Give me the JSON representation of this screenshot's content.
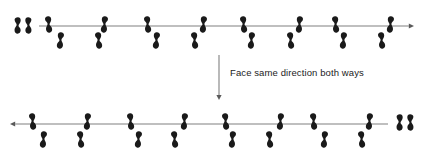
{
  "canvas": {
    "width": 424,
    "height": 151,
    "background": "#ffffff"
  },
  "colors": {
    "footprint": "#1a1a1a",
    "axis_line": "#808080",
    "arrow_head": "#5a5a5a",
    "text": "#1c1c1c"
  },
  "caption": {
    "label": "Face same direction both ways",
    "x": 230,
    "y": 68
  },
  "transition_arrow": {
    "name": "down-arrow",
    "direction": "down",
    "x": 219,
    "y_start": 55,
    "y_end": 100
  },
  "rows": [
    {
      "id": "top-row",
      "name": "walking-path-left-to-right",
      "direction": "right",
      "axis": {
        "x_start": 39,
        "x_end": 414,
        "y": 26,
        "arrow_direction": "right"
      },
      "start_pair": {
        "name": "start-position-pair",
        "feet": [
          {
            "side": "left",
            "x": 14,
            "y": 17,
            "rotation": 0
          },
          {
            "side": "right",
            "x": 25,
            "y": 17,
            "rotation": 0
          }
        ]
      },
      "steps_above": [
        {
          "side": "left",
          "x": 45,
          "y": 16,
          "rotation": -6
        },
        {
          "side": "right",
          "x": 101,
          "y": 16,
          "rotation": 6
        },
        {
          "side": "left",
          "x": 144,
          "y": 16,
          "rotation": -6
        },
        {
          "side": "right",
          "x": 200,
          "y": 16,
          "rotation": 6
        },
        {
          "side": "left",
          "x": 240,
          "y": 16,
          "rotation": -6
        },
        {
          "side": "right",
          "x": 296,
          "y": 16,
          "rotation": 6
        },
        {
          "side": "left",
          "x": 332,
          "y": 16,
          "rotation": -6
        },
        {
          "side": "right",
          "x": 387,
          "y": 16,
          "rotation": 6
        }
      ],
      "steps_below": [
        {
          "side": "right",
          "x": 57,
          "y": 32,
          "rotation": 6
        },
        {
          "side": "left",
          "x": 95,
          "y": 32,
          "rotation": -6
        },
        {
          "side": "right",
          "x": 153,
          "y": 32,
          "rotation": 6
        },
        {
          "side": "left",
          "x": 191,
          "y": 32,
          "rotation": -6
        },
        {
          "side": "right",
          "x": 248,
          "y": 32,
          "rotation": 6
        },
        {
          "side": "left",
          "x": 287,
          "y": 32,
          "rotation": -6
        },
        {
          "side": "right",
          "x": 340,
          "y": 32,
          "rotation": 6
        },
        {
          "side": "left",
          "x": 378,
          "y": 32,
          "rotation": -6
        }
      ]
    },
    {
      "id": "bottom-row",
      "name": "walking-path-right-to-left",
      "direction": "left",
      "axis": {
        "x_start": 10,
        "x_end": 388,
        "y": 124,
        "arrow_direction": "left"
      },
      "start_pair": {
        "name": "start-position-pair",
        "feet": [
          {
            "side": "left",
            "x": 396,
            "y": 114,
            "rotation": 0
          },
          {
            "side": "right",
            "x": 407,
            "y": 114,
            "rotation": 0
          }
        ]
      },
      "steps_above": [
        {
          "side": "left",
          "x": 29,
          "y": 113,
          "rotation": -6
        },
        {
          "side": "right",
          "x": 84,
          "y": 113,
          "rotation": 6
        },
        {
          "side": "left",
          "x": 127,
          "y": 113,
          "rotation": -6
        },
        {
          "side": "right",
          "x": 181,
          "y": 113,
          "rotation": 6
        },
        {
          "side": "left",
          "x": 222,
          "y": 113,
          "rotation": -6
        },
        {
          "side": "right",
          "x": 277,
          "y": 113,
          "rotation": 6
        },
        {
          "side": "left",
          "x": 310,
          "y": 113,
          "rotation": -6
        },
        {
          "side": "right",
          "x": 366,
          "y": 113,
          "rotation": 6
        }
      ],
      "steps_below": [
        {
          "side": "right",
          "x": 40,
          "y": 131,
          "rotation": 6
        },
        {
          "side": "left",
          "x": 77,
          "y": 131,
          "rotation": -6
        },
        {
          "side": "right",
          "x": 135,
          "y": 131,
          "rotation": 6
        },
        {
          "side": "left",
          "x": 171,
          "y": 131,
          "rotation": -6
        },
        {
          "side": "right",
          "x": 229,
          "y": 131,
          "rotation": 6
        },
        {
          "side": "left",
          "x": 266,
          "y": 131,
          "rotation": -6
        },
        {
          "side": "right",
          "x": 321,
          "y": 131,
          "rotation": 6
        },
        {
          "side": "left",
          "x": 358,
          "y": 131,
          "rotation": -6
        }
      ]
    }
  ]
}
